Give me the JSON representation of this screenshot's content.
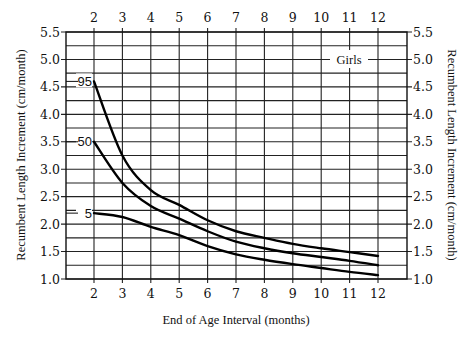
{
  "chart_data": {
    "type": "line",
    "title": "",
    "legend_text": "Girls",
    "xlabel": "End of Age Interval (months)",
    "ylabel": "Recumbent Length Increment (cm/month)",
    "ylabel_right": "Recumbent Length Increment (cm/month)",
    "x": [
      2,
      3,
      4,
      5,
      6,
      7,
      8,
      9,
      10,
      11,
      12
    ],
    "x_ticks": [
      "2",
      "3",
      "4",
      "5",
      "6",
      "7",
      "8",
      "9",
      "10",
      "11",
      "12"
    ],
    "y_ticks": [
      "1.0",
      "1.5",
      "2.0",
      "2.5",
      "3.0",
      "3.5",
      "4.0",
      "4.5",
      "5.0",
      "5.5"
    ],
    "y_tick_values": [
      1.0,
      1.5,
      2.0,
      2.5,
      3.0,
      3.5,
      4.0,
      4.5,
      5.0,
      5.5
    ],
    "xlim": [
      1,
      13
    ],
    "ylim": [
      1.0,
      5.5
    ],
    "grid": true,
    "grid_minor_y_step": 0.25,
    "series": [
      {
        "name": "95",
        "label": "95",
        "values": [
          4.6,
          3.25,
          2.62,
          2.35,
          2.07,
          1.87,
          1.75,
          1.64,
          1.56,
          1.49,
          1.42
        ]
      },
      {
        "name": "50",
        "label": "50",
        "values": [
          3.5,
          2.75,
          2.33,
          2.1,
          1.87,
          1.68,
          1.56,
          1.47,
          1.4,
          1.33,
          1.25
        ]
      },
      {
        "name": "5",
        "label": "5",
        "values": [
          2.2,
          2.13,
          1.95,
          1.8,
          1.6,
          1.45,
          1.35,
          1.27,
          1.2,
          1.13,
          1.07
        ]
      }
    ]
  }
}
